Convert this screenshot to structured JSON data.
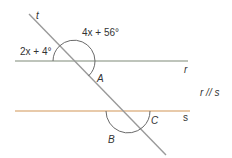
{
  "diagram": {
    "lines": {
      "r": {
        "label": "r",
        "color": "#a8b0a4"
      },
      "s": {
        "label": "s",
        "color": "#e0b98e"
      },
      "t": {
        "label": "t",
        "color": "#9a9a9a"
      }
    },
    "angle_labels": {
      "left_top": "2x + 4°",
      "right_top": "4x + 56°",
      "A": "A",
      "B": "B",
      "C": "C"
    },
    "relation": "r // s",
    "arc_color": "#6a6a6a"
  }
}
